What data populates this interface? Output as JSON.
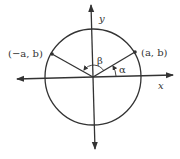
{
  "diagram": {
    "axis_labels": {
      "x": "x",
      "y": "y"
    },
    "points": [
      {
        "name": "right-point",
        "label": "(a, b)"
      },
      {
        "name": "left-point",
        "label": "(−a, b)"
      }
    ],
    "angles": [
      {
        "name": "alpha",
        "label": "α"
      },
      {
        "name": "beta",
        "label": "β"
      }
    ],
    "colors": {
      "stroke": "#333333",
      "background": "#ffffff"
    }
  }
}
